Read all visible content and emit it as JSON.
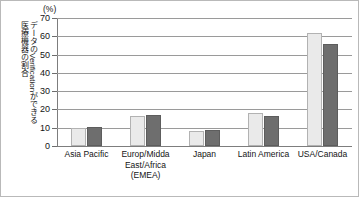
{
  "chart_data": {
    "type": "bar",
    "title": "",
    "subtitle": "",
    "unit_label": "(%)",
    "ylabel_lines": [
      "データのVerificationができる",
      "医療機器の割合"
    ],
    "xlabel": "",
    "ylim": [
      0,
      70
    ],
    "yticks": [
      0,
      10,
      20,
      30,
      40,
      50,
      60,
      70
    ],
    "ytick_labels": [
      "0",
      "10",
      "20",
      "30",
      "40",
      "50",
      "60",
      "70"
    ],
    "grid": true,
    "legend": "none",
    "categories": [
      "Asia Pacific",
      "Europ/Midda East/Africa (EMEA)",
      "Japan",
      "Latin America",
      "USA/Canada"
    ],
    "category_label_lines": [
      [
        "Asia Pacific"
      ],
      [
        "Europ/Midda",
        "East/Africa",
        "(EMEA)"
      ],
      [
        "Japan"
      ],
      [
        "Latin America"
      ],
      [
        "USA/Canada"
      ]
    ],
    "series": [
      {
        "name": "series-1",
        "color": "#eaeaea",
        "values": [
          10,
          16.5,
          8,
          18,
          62
        ]
      },
      {
        "name": "series-2",
        "color": "#6e6e6e",
        "values": [
          10.5,
          17,
          8.5,
          16.5,
          56
        ]
      }
    ]
  },
  "colors": {
    "series_light": "#eaeaea",
    "series_light_border": "#b2b2b2",
    "series_dark": "#6e6e6e",
    "series_dark_border": "#5d5d5d",
    "gridline": "#9a9a9a",
    "axis": "#7d7d7d",
    "frame_border": "#b9b9b9",
    "text": "#141414",
    "background": "#ffffff"
  }
}
